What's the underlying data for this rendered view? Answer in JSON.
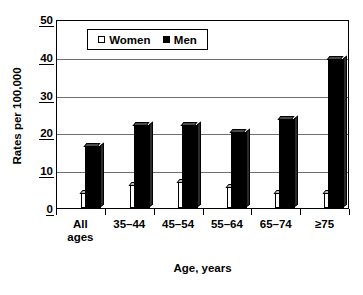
{
  "chart_data": {
    "type": "bar",
    "title": "",
    "xlabel": "Age, years",
    "ylabel": "Rates per 100,000",
    "categories": [
      "All\nages",
      "35–44",
      "45–54",
      "55–64",
      "65–74",
      "≥75"
    ],
    "series": [
      {
        "name": "Women",
        "values": [
          4,
          6,
          7,
          5.5,
          4,
          4
        ],
        "color": "#ffffff"
      },
      {
        "name": "Men",
        "values": [
          16.5,
          22,
          22,
          20,
          23.5,
          39.5
        ],
        "color": "#000000"
      }
    ],
    "ylim": [
      0,
      50
    ],
    "yticks": [
      0,
      10,
      20,
      30,
      40,
      50
    ],
    "ytick_labels": [
      "0",
      "10",
      "20",
      "30",
      "40",
      "50"
    ],
    "grid": true,
    "legend_position": "top-center",
    "legend_entries": [
      {
        "label": "Women",
        "marker": "open-square"
      },
      {
        "label": "Men",
        "marker": "filled-square"
      }
    ]
  }
}
